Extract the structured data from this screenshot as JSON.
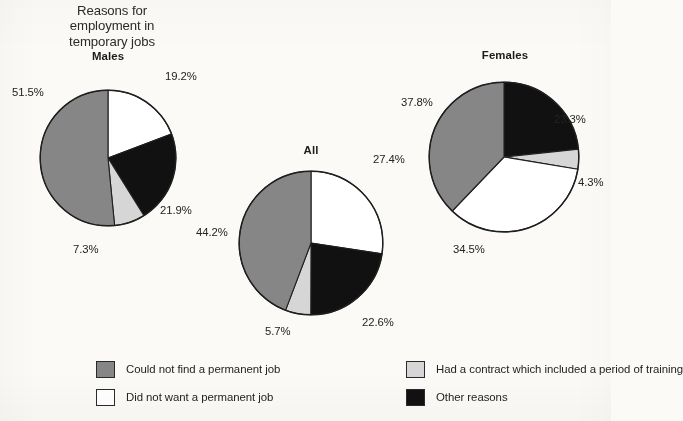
{
  "title": {
    "lines": [
      "Reasons for",
      "employment in",
      "temporary jobs"
    ]
  },
  "colors": {
    "could_not_find": "#868686",
    "did_not_want": "#ffffff",
    "had_contract": "#d6d6d6",
    "other_reasons": "#111111",
    "outline": "#1f1f1f",
    "background": "#fbfaf7"
  },
  "legend": {
    "items": [
      {
        "label": "Could not find a permanent job",
        "color": "#868686",
        "key": "could_not_find"
      },
      {
        "label": "Had a contract which included a period of training",
        "color": "#d6d6d6",
        "key": "had_contract"
      },
      {
        "label": "Did not want a permanent job",
        "color": "#ffffff",
        "key": "did_not_want"
      },
      {
        "label": "Other reasons",
        "color": "#111111",
        "key": "other_reasons"
      }
    ]
  },
  "pies": {
    "males": {
      "heading": "Males",
      "labels": [
        "19.2%",
        "21.9%",
        "7.3%",
        "51.5%"
      ]
    },
    "all": {
      "heading": "All",
      "labels": [
        "27.4%",
        "22.6%",
        "5.7%",
        "44.2%"
      ]
    },
    "females": {
      "heading": "Females",
      "labels": [
        "23.3%",
        "4.3%",
        "34.5%",
        "37.8%"
      ]
    }
  },
  "chart_data": {
    "type": "pie",
    "title": "Reasons for employment in temporary jobs",
    "subtitle": "",
    "xlabel": "",
    "ylabel": "",
    "units": "percent",
    "legend_position": "bottom",
    "grid": false,
    "categories": [
      "Could not find a permanent job",
      "Had a contract which included a period of training",
      "Did not want a permanent job",
      "Other reasons"
    ],
    "category_colors": {
      "Could not find a permanent job": "#868686",
      "Had a contract which included a period of training": "#d6d6d6",
      "Did not want a permanent job": "#ffffff",
      "Other reasons": "#111111"
    },
    "charts": [
      {
        "name": "Males",
        "start_angle_deg": 0,
        "direction": "clockwise",
        "slices": [
          {
            "category": "Did not want a permanent job",
            "value": 19.2,
            "label": "19.2%",
            "color": "#ffffff"
          },
          {
            "category": "Other reasons",
            "value": 21.9,
            "label": "21.9%",
            "color": "#111111"
          },
          {
            "category": "Had a contract which included a period of training",
            "value": 7.3,
            "label": "7.3%",
            "color": "#d6d6d6"
          },
          {
            "category": "Could not find a permanent job",
            "value": 51.5,
            "label": "51.5%",
            "color": "#868686"
          }
        ]
      },
      {
        "name": "All",
        "start_angle_deg": 0,
        "direction": "clockwise",
        "slices": [
          {
            "category": "Did not want a permanent job",
            "value": 27.4,
            "label": "27.4%",
            "color": "#ffffff"
          },
          {
            "category": "Other reasons",
            "value": 22.6,
            "label": "22.6%",
            "color": "#111111"
          },
          {
            "category": "Had a contract which included a period of training",
            "value": 5.7,
            "label": "5.7%",
            "color": "#d6d6d6"
          },
          {
            "category": "Could not find a permanent job",
            "value": 44.2,
            "label": "44.2%",
            "color": "#868686"
          }
        ]
      },
      {
        "name": "Females",
        "start_angle_deg": 0,
        "direction": "clockwise",
        "slices": [
          {
            "category": "Other reasons",
            "value": 23.3,
            "label": "23.3%",
            "color": "#111111"
          },
          {
            "category": "Had a contract which included a period of training",
            "value": 4.3,
            "label": "4.3%",
            "color": "#d6d6d6"
          },
          {
            "category": "Did not want a permanent job",
            "value": 34.5,
            "label": "34.5%",
            "color": "#ffffff"
          },
          {
            "category": "Could not find a permanent job",
            "value": 37.8,
            "label": "37.8%",
            "color": "#868686"
          }
        ]
      }
    ]
  }
}
